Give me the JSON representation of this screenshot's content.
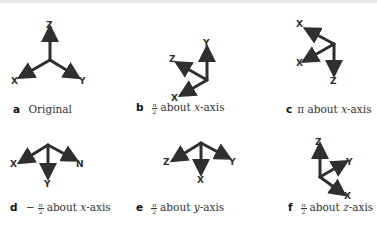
{
  "figure": {
    "panels": [
      {
        "letter": "a",
        "prefix": "",
        "frac_num": "",
        "frac_den": "",
        "text": "Original",
        "axis_var": "",
        "axis_suffix": ""
      },
      {
        "letter": "b",
        "prefix": "",
        "frac_num": "π",
        "frac_den": "2",
        "text": "about",
        "axis_var": "x",
        "axis_suffix": "-axis"
      },
      {
        "letter": "c",
        "prefix": "π",
        "frac_num": "",
        "frac_den": "",
        "text": "about",
        "axis_var": "x",
        "axis_suffix": "-axis"
      },
      {
        "letter": "d",
        "prefix": "−",
        "frac_num": "π",
        "frac_den": "2",
        "text": "about",
        "axis_var": "x",
        "axis_suffix": "-axis"
      },
      {
        "letter": "e",
        "prefix": "",
        "frac_num": "π",
        "frac_den": "2",
        "text": "about",
        "axis_var": "y",
        "axis_suffix": "-axis"
      },
      {
        "letter": "f",
        "prefix": "",
        "frac_num": "π",
        "frac_den": "2",
        "text": "about",
        "axis_var": "z",
        "axis_suffix": "-axis"
      }
    ],
    "axis_labels": {
      "x": "X",
      "y": "Y",
      "z": "Z"
    },
    "colors": {
      "arrow": "#2f2f2f",
      "text": "#333333",
      "background": "#ffffff"
    }
  }
}
